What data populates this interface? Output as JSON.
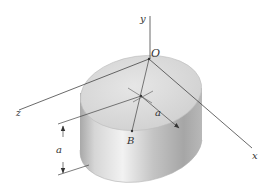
{
  "figure": {
    "labels": {
      "origin": "O",
      "y_axis": "y",
      "z_axis": "z",
      "x_axis": "x",
      "point_b": "B",
      "radius": "a",
      "height": "a"
    },
    "colors": {
      "top_face": "#d9d9d9",
      "side_light": "#e8e8e8",
      "side_dark": "#9a9a9a",
      "lines": "#444444",
      "background": "#ffffff"
    }
  }
}
